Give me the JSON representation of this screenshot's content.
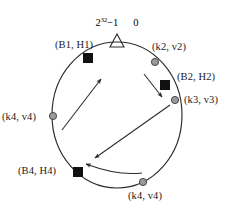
{
  "figure": {
    "type": "consistent-hashing-ring",
    "top_axis": {
      "max_label_base": "2",
      "max_label_exponent": "32",
      "max_label_suffix": "−1",
      "zero_label": "0",
      "marker": "triangle-notch"
    },
    "colors": {
      "ring_stroke": "#2b2b2b",
      "server_marker": "#111111",
      "key_marker_fill": "#9a9a9a",
      "key_marker_stroke": "#3a3a3a",
      "arrow": "#2b2b2b",
      "text": "#1a1a1a",
      "background": "#ffffff"
    },
    "ring": {
      "cx": 117,
      "cy": 115,
      "rx": 65,
      "ry": 73
    },
    "servers": [
      {
        "id": "B1",
        "label": "(B1, H1)",
        "marker": "square",
        "x": 88,
        "y": 58,
        "label_x": 55,
        "label_y": 40,
        "anchor": "left"
      },
      {
        "id": "B2",
        "label": "(B2, H2)",
        "marker": "square",
        "x": 165,
        "y": 85,
        "label_x": 177,
        "label_y": 72,
        "anchor": "left"
      },
      {
        "id": "B4",
        "label": "(B4, H4)",
        "marker": "square",
        "x": 78,
        "y": 172,
        "label_x": 18,
        "label_y": 166,
        "anchor": "left"
      }
    ],
    "keys": [
      {
        "id": "k2",
        "label": "(k2, v2)",
        "marker": "circle",
        "x": 155,
        "y": 62,
        "label_x": 152,
        "label_y": 42,
        "anchor": "left"
      },
      {
        "id": "k3",
        "label": "(k3, v3)",
        "marker": "circle",
        "x": 175,
        "y": 100,
        "label_x": 184,
        "label_y": 95,
        "anchor": "left"
      },
      {
        "id": "k4a",
        "label": "(k4, v4)",
        "marker": "circle",
        "x": 53,
        "y": 116,
        "label_x": 2,
        "label_y": 112,
        "anchor": "left"
      },
      {
        "id": "k4b",
        "label": "(k4, v4)",
        "marker": "circle",
        "x": 143,
        "y": 182,
        "label_x": 128,
        "label_y": 191,
        "anchor": "left"
      }
    ],
    "arrows": [
      {
        "name": "k4-left-to-B1",
        "from_x": 62,
        "from_y": 130,
        "to_x": 101,
        "to_y": 79,
        "curved": false
      },
      {
        "name": "k2-to-B2",
        "from_x": 144,
        "from_y": 74,
        "to_x": 162,
        "to_y": 97,
        "curved": false
      },
      {
        "name": "k3-to-B4-long",
        "from_x": 170,
        "from_y": 105,
        "to_x": 95,
        "to_y": 158,
        "curved": false
      },
      {
        "name": "k4-bottom-to-B4",
        "from_x": 142,
        "from_y": 172,
        "to_x": 86,
        "to_y": 164,
        "curved": true
      }
    ]
  }
}
